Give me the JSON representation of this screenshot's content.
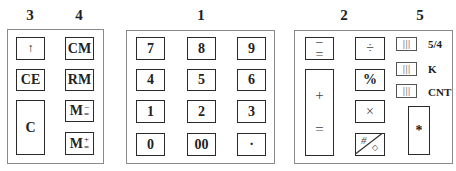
{
  "group_labels": {
    "g3": "3",
    "g4": "4",
    "g1": "1",
    "g2": "2",
    "g5": "5"
  },
  "left_panel": {
    "col3": {
      "up": "↑",
      "ce": "CE",
      "c": "C"
    },
    "col4": {
      "cm": "CM",
      "rm": "RM",
      "m_minus": {
        "m": "M",
        "top": "−",
        "bottom": "="
      },
      "m_plus": {
        "m": "M",
        "top": "+",
        "bottom": "="
      }
    }
  },
  "numpad": {
    "rows": [
      [
        "7",
        "8",
        "9"
      ],
      [
        "4",
        "5",
        "6"
      ],
      [
        "1",
        "2",
        "3"
      ],
      [
        "0",
        "00",
        "·"
      ]
    ]
  },
  "right_panel": {
    "minus_equals": {
      "top": "−",
      "bottom": "="
    },
    "plus_equals": {
      "top": "+",
      "bottom": "="
    },
    "divide": "÷",
    "percent": "%",
    "multiply": "×",
    "hash_diamond": {
      "top": "#",
      "bottom": "◇"
    },
    "switches": [
      {
        "glyph": "|||",
        "label": "5/4"
      },
      {
        "glyph": "|||",
        "label": "K"
      },
      {
        "glyph": "|||",
        "label": "CNT"
      }
    ],
    "star": "*"
  }
}
